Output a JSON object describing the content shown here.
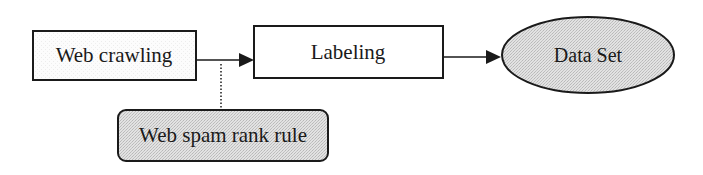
{
  "diagram": {
    "nodes": {
      "web_crawling": {
        "label": "Web crawling",
        "shape": "rectangle",
        "fill": "#fafafa"
      },
      "labeling": {
        "label": "Labeling",
        "shape": "rectangle",
        "fill": "#ffffff"
      },
      "data_set": {
        "label": "Data Set",
        "shape": "ellipse",
        "fill": "#d9d9d9"
      },
      "web_spam_rank_rule": {
        "label": "Web spam rank rule",
        "shape": "rounded-rectangle",
        "fill": "#d9d9d9"
      }
    },
    "edges": [
      {
        "from": "web_crawling",
        "to": "labeling",
        "style": "solid-arrow"
      },
      {
        "from": "labeling",
        "to": "data_set",
        "style": "solid-arrow"
      },
      {
        "from": "web_spam_rank_rule",
        "to": "web_crawling-labeling-edge",
        "style": "dotted"
      }
    ],
    "colors": {
      "stroke": "#1a1a1a",
      "shaded_fill": "#d9d9d9"
    }
  }
}
